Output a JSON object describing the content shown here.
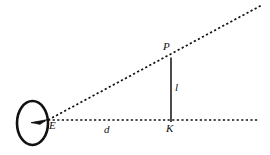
{
  "figure": {
    "background_color": "#ffffff",
    "stroke_color": "#111111",
    "canvas": {
      "width": 270,
      "height": 155
    }
  },
  "labels": {
    "eye_point": "E",
    "distance": "d",
    "foot_point": "K",
    "object_top": "P",
    "object_height": "l"
  },
  "geometry": {
    "eye": {
      "name": "eye-symbol",
      "center_x": 32.5,
      "center_y": 123,
      "radius_x": 15.5,
      "radius_y": 22,
      "stroke_width": 2.6
    },
    "pupil_wedge": {
      "name": "pupil-wedge",
      "tip_x": 47,
      "tip_y": 120
    },
    "point_E": {
      "x": 48,
      "y": 120
    },
    "point_K": {
      "x": 171,
      "y": 121
    },
    "point_P": {
      "x": 171,
      "y": 58
    },
    "baseline": {
      "name": "baseline-dotted",
      "x1": 48,
      "y1": 120,
      "x2": 258,
      "y2": 120,
      "style": "dotted"
    },
    "sight_line": {
      "name": "sight-line-dotted",
      "x1": 48,
      "y1": 120,
      "x2": 262,
      "y2": 5,
      "style": "dotted"
    },
    "object_segment": {
      "name": "object-segment-solid",
      "x1": 171,
      "y1": 58,
      "x2": 171,
      "y2": 122,
      "style": "solid"
    }
  }
}
